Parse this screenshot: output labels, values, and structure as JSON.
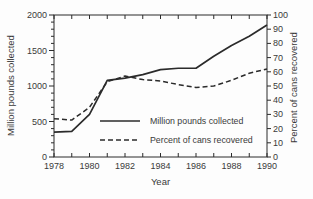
{
  "figure": {
    "background": "#fdfdfd",
    "ink_color": "#2b2b2b",
    "text_color": "#3a3a3a"
  },
  "chart_data": {
    "type": "line",
    "title": "",
    "xlabel": "Year",
    "ylabel_left": "Million pounds collected",
    "ylabel_right": "Percent of cans recovered",
    "x": [
      1978,
      1979,
      1980,
      1981,
      1982,
      1983,
      1984,
      1985,
      1986,
      1987,
      1988,
      1989,
      1990
    ],
    "x_tick_labels": [
      "1978",
      "1980",
      "1982",
      "1984",
      "1986",
      "1988",
      "1990"
    ],
    "x_minor_ticks_every_year": true,
    "left_axis": {
      "range": [
        0,
        2000
      ],
      "major_ticks": [
        0,
        500,
        1000,
        1500,
        2000
      ],
      "minor_tick_interval": 100
    },
    "right_axis": {
      "range": [
        0,
        100
      ],
      "major_ticks": [
        0,
        10,
        20,
        30,
        40,
        50,
        60,
        70,
        80,
        90,
        100
      ]
    },
    "grid": false,
    "frame": "box",
    "series": [
      {
        "name": "Million pounds collected",
        "axis": "left",
        "style": "solid",
        "values": [
          350,
          360,
          600,
          1080,
          1110,
          1160,
          1230,
          1250,
          1250,
          1420,
          1570,
          1700,
          1860
        ]
      },
      {
        "name": "Percent of cans recovered",
        "axis": "right",
        "style": "dashed",
        "values": [
          27,
          26,
          35,
          53,
          57,
          54.5,
          53.5,
          51,
          49,
          50,
          54,
          59,
          62
        ]
      }
    ],
    "legend": {
      "position": "inside-lower-center",
      "entries": [
        {
          "label": "Million pounds collected",
          "style": "solid"
        },
        {
          "label": "Percent of cans recovered",
          "style": "dashed"
        }
      ]
    }
  }
}
